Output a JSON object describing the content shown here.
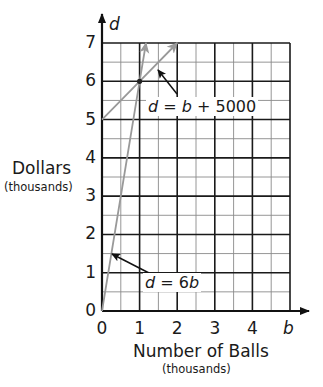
{
  "chart_data": {
    "type": "line",
    "title": "",
    "xlabel": "Number of Balls",
    "xlabel_sub": "(thousands)",
    "ylabel": "Dollars",
    "ylabel_sub": "(thousands)",
    "x_axis_var": "b",
    "y_axis_var": "d",
    "xlim": [
      0,
      5
    ],
    "ylim": [
      0,
      7
    ],
    "x_ticks": [
      "0",
      "1",
      "2",
      "3",
      "4"
    ],
    "y_ticks": [
      "0",
      "1",
      "2",
      "3",
      "4",
      "5",
      "6",
      "7"
    ],
    "grid": true,
    "grid_minor_step": 0.5,
    "series": [
      {
        "name": "d = 6b",
        "label": "d = 6b",
        "points": [
          [
            0,
            0
          ],
          [
            1,
            6
          ],
          [
            1.17,
            7
          ]
        ],
        "color": "#999999"
      },
      {
        "name": "d = b + 5000",
        "label": "d = b + 5000",
        "points": [
          [
            0,
            5
          ],
          [
            1,
            6
          ],
          [
            2,
            7
          ]
        ],
        "color": "#999999"
      }
    ],
    "annotations": [
      {
        "text": "d = b + 5000",
        "points_to": [
          1.5,
          6.5
        ]
      },
      {
        "text": "d = 6b",
        "points_to": [
          0.25,
          1.5
        ]
      },
      {
        "text": "intersection",
        "point": [
          1,
          6
        ]
      }
    ]
  },
  "labels": {
    "y_var": "d",
    "x_var": "b",
    "ylabel": "Dollars",
    "ylabel_sub": "(thousands)",
    "xlabel": "Number of Balls",
    "xlabel_sub": "(thousands)",
    "eq1_lhs": "d",
    "eq1_rhs_var": "b",
    "eq1_rest": " + 5000",
    "eq2_lhs": "d",
    "eq2_coef": "6",
    "eq2_var": "b",
    "equals": " = "
  }
}
